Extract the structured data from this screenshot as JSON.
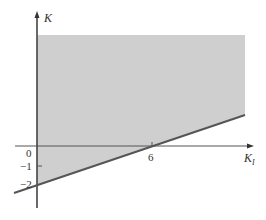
{
  "diagram": {
    "type": "feasible-region",
    "axes": {
      "x_label": "K",
      "x_label_subscript": "I",
      "y_label": "K"
    },
    "ticks": {
      "x": [
        {
          "value": 6,
          "label": "6"
        }
      ],
      "y": [
        {
          "value": 0,
          "label": "0"
        },
        {
          "value": -1,
          "label": "−1"
        },
        {
          "value": -2,
          "label": "−2"
        }
      ]
    },
    "boundary_line": {
      "description": "line through (0,-2) and (6,0)",
      "equation": "K = K_I/3 - 2"
    },
    "shaded_region": "area above the line and right of K axis",
    "colors": {
      "shade": "#cfcfcf",
      "line": "#555555",
      "axis": "#444444"
    }
  }
}
